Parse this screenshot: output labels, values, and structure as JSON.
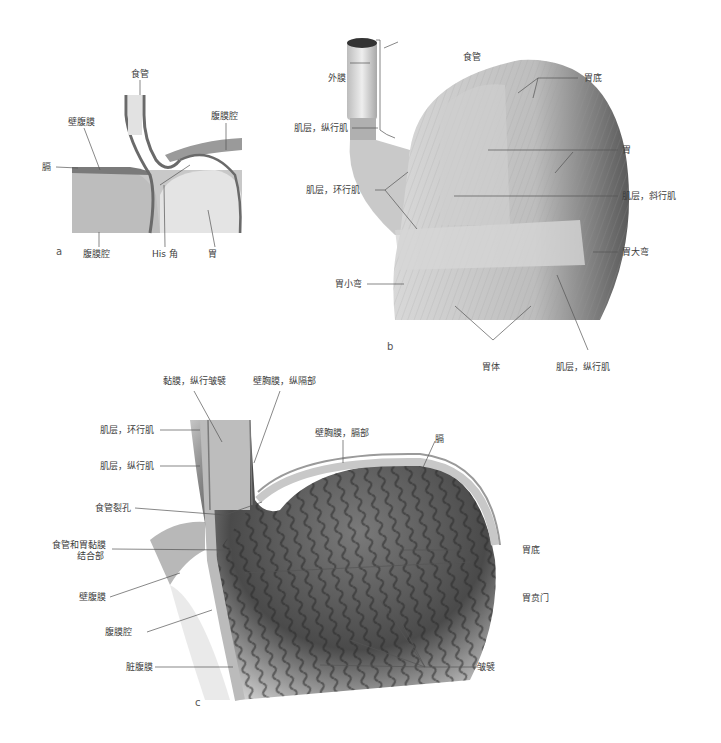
{
  "figure": {
    "panels": [
      {
        "id": "a",
        "letter": "a",
        "labels": {
          "esophagus": "食管",
          "peritoneal_cavity_top": "腹膜腔",
          "parietal_peritoneum": "壁腹膜",
          "diaphragm": "膈",
          "peritoneal_cavity_bottom": "腹膜腔",
          "his_angle": "His 角",
          "stomach": "胃"
        }
      },
      {
        "id": "b",
        "letter": "b",
        "labels": {
          "esophagus": "食管",
          "adventitia": "外膜",
          "muscle_longitudinal_top": "肌层，纵行肌",
          "muscle_circular": "肌层，环行肌",
          "fundus": "胃底",
          "stomach": "胃",
          "muscle_oblique": "肌层，斜行肌",
          "greater_curvature": "胃大弯",
          "lesser_curvature": "胃小弯",
          "body": "胃体",
          "muscle_longitudinal_bottom": "肌层，纵行肌"
        }
      },
      {
        "id": "c",
        "letter": "c",
        "labels": {
          "mucosa_folds": "黏膜，纵行皱襞",
          "mediastinal_pleura": "壁胸膜，纵隔部",
          "muscle_circular": "肌层，环行肌",
          "diaphragmatic_pleura": "壁胸膜，膈部",
          "muscle_longitudinal": "肌层，纵行肌",
          "diaphragm": "膈",
          "esophageal_hiatus": "食管裂孔",
          "junction_line1": "食管和胃黏膜",
          "junction_line2": "结合部",
          "fundus": "胃底",
          "parietal_peritoneum": "壁腹膜",
          "cardia": "胃贲门",
          "peritoneal_cavity": "腹膜腔",
          "visceral_peritoneum": "脏腹膜",
          "rugae": "皱襞"
        }
      }
    ]
  }
}
